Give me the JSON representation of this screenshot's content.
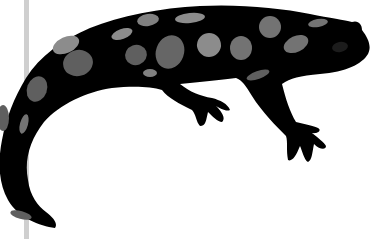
{
  "image": {
    "subject": "spotted salamander silhouette",
    "colors": {
      "background": "#ffffff",
      "body": "#000000",
      "spot_dark": "#5f5f5f",
      "spot_mid": "#737373",
      "spot_light": "#8c8c8c",
      "side_bar": "#cfcfcf"
    }
  }
}
